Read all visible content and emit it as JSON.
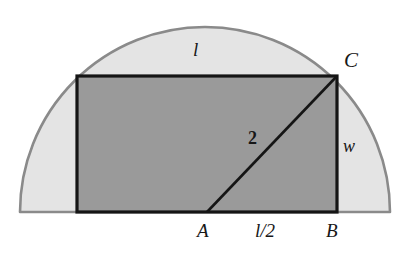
{
  "figure": {
    "canvas": {
      "width": 400,
      "height": 259,
      "background": "#ffffff"
    },
    "colors": {
      "semicircle_fill": "#e4e4e4",
      "semicircle_stroke": "#8a8a8a",
      "rectangle_fill": "#9a9a9a",
      "rectangle_stroke": "#151515",
      "diagonal_stroke": "#151515",
      "label_color": "#171717"
    },
    "shapes": {
      "semicircle": {
        "name": "semicircle",
        "center_x": 205,
        "baseline_y": 212,
        "radius": 185,
        "left_x": 20,
        "right_x": 390,
        "apex_y": 27
      },
      "rectangle": {
        "name": "inscribed-rectangle",
        "left": 77,
        "top": 76,
        "right": 337,
        "bottom": 212,
        "width": 260,
        "height": 136
      },
      "diagonal": {
        "name": "diagonal-segment",
        "from": {
          "point": "A",
          "x": 207,
          "y": 212
        },
        "to": {
          "point": "C",
          "x": 337,
          "y": 76
        }
      }
    },
    "labels": {
      "length": "l",
      "vertex_c": "C",
      "diagonal_length": "2",
      "width": "w",
      "vertex_a": "A",
      "half_length": "l/2",
      "vertex_b": "B"
    }
  }
}
